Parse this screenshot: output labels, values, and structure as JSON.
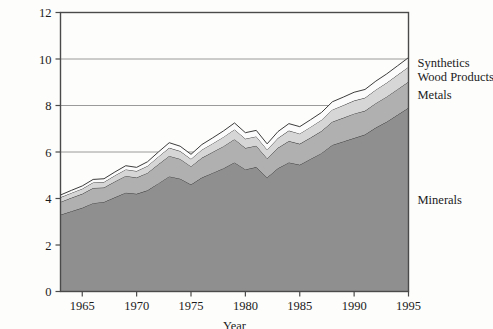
{
  "chart_data": {
    "type": "area",
    "stacked": true,
    "title": "",
    "subtitle": "",
    "xlabel": "Year",
    "ylabel": "",
    "xlim": [
      1963,
      1995
    ],
    "ylim": [
      0,
      12
    ],
    "xticks": [
      1965,
      1970,
      1975,
      1980,
      1985,
      1990,
      1995
    ],
    "xticklabels": [
      "1965",
      "1970",
      "1975",
      "1980",
      "1985",
      "1990",
      "1995"
    ],
    "yticks": [
      0,
      2,
      4,
      6,
      8,
      10,
      12
    ],
    "yticklabels": [
      "0",
      "2",
      "4",
      "6",
      "8",
      "10",
      "12"
    ],
    "gridlines_y": [
      6,
      8,
      10,
      12
    ],
    "grid": true,
    "legend_position": "right-inline",
    "x": [
      1963,
      1964,
      1965,
      1966,
      1967,
      1968,
      1969,
      1970,
      1971,
      1972,
      1973,
      1974,
      1975,
      1976,
      1977,
      1978,
      1979,
      1980,
      1981,
      1982,
      1983,
      1984,
      1985,
      1986,
      1987,
      1988,
      1989,
      1990,
      1991,
      1992,
      1993,
      1994,
      1995
    ],
    "series": [
      {
        "name": "Minerals",
        "color": "#8f8f8f",
        "values": [
          3.3,
          3.45,
          3.6,
          3.8,
          3.85,
          4.05,
          4.25,
          4.2,
          4.35,
          4.65,
          4.95,
          4.85,
          4.6,
          4.9,
          5.1,
          5.3,
          5.55,
          5.25,
          5.35,
          4.9,
          5.3,
          5.55,
          5.45,
          5.7,
          5.95,
          6.3,
          6.45,
          6.6,
          6.75,
          7.05,
          7.3,
          7.6,
          7.9
        ]
      },
      {
        "name": "Metals",
        "color": "#b0b0b0",
        "values": [
          0.55,
          0.58,
          0.6,
          0.65,
          0.62,
          0.68,
          0.72,
          0.7,
          0.75,
          0.82,
          0.88,
          0.85,
          0.78,
          0.85,
          0.9,
          0.95,
          1.0,
          0.92,
          0.92,
          0.82,
          0.88,
          0.92,
          0.9,
          0.92,
          0.95,
          1.0,
          1.02,
          1.05,
          1.02,
          1.05,
          1.08,
          1.1,
          1.12
        ]
      },
      {
        "name": "Wood Products",
        "color": "#d6d6d6",
        "values": [
          0.2,
          0.21,
          0.22,
          0.24,
          0.24,
          0.26,
          0.28,
          0.28,
          0.3,
          0.33,
          0.35,
          0.34,
          0.32,
          0.35,
          0.37,
          0.4,
          0.42,
          0.4,
          0.4,
          0.38,
          0.42,
          0.45,
          0.44,
          0.46,
          0.48,
          0.52,
          0.54,
          0.56,
          0.56,
          0.58,
          0.6,
          0.62,
          0.64
        ]
      },
      {
        "name": "Synthetics",
        "color": "#fbfbfb",
        "values": [
          0.1,
          0.11,
          0.12,
          0.13,
          0.14,
          0.15,
          0.16,
          0.16,
          0.18,
          0.2,
          0.22,
          0.21,
          0.2,
          0.22,
          0.24,
          0.26,
          0.28,
          0.26,
          0.26,
          0.25,
          0.28,
          0.3,
          0.3,
          0.31,
          0.32,
          0.34,
          0.35,
          0.36,
          0.36,
          0.37,
          0.38,
          0.39,
          0.4
        ]
      }
    ],
    "totals": [
      4.15,
      4.35,
      4.54,
      4.82,
      4.85,
      5.14,
      5.41,
      5.34,
      5.58,
      6.0,
      6.4,
      6.25,
      5.9,
      6.32,
      6.61,
      6.91,
      7.25,
      6.83,
      6.93,
      6.35,
      6.88,
      7.22,
      7.09,
      7.39,
      7.7,
      8.16,
      8.36,
      8.57,
      8.69,
      9.05,
      9.36,
      9.71,
      10.06
    ],
    "labels": {
      "synthetics": "Synthetics",
      "wood_products": "Wood Products",
      "metals": "Metals",
      "minerals": "Minerals"
    },
    "colors": {
      "minerals": "#8f8f8f",
      "metals": "#b0b0b0",
      "wood_products": "#d6d6d6",
      "synthetics": "#fbfbfb",
      "frame": "#4a4a4a",
      "gridline": "#9a9a9a",
      "outline": "#3c3c3c",
      "background": "#fdfdfb",
      "text": "#1b1b1b"
    }
  }
}
